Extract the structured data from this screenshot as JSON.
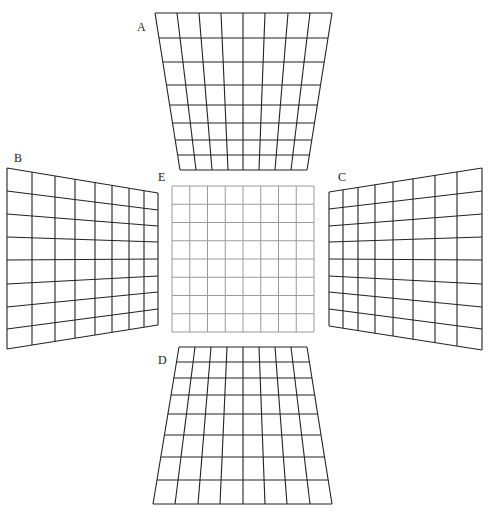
{
  "labels": {
    "A": "A",
    "B": "B",
    "C": "C",
    "D": "D",
    "E": "E"
  },
  "colors": {
    "distorted": "#222222",
    "reference": "#9a9a9a"
  },
  "grids": {
    "A": {
      "cols": [
        [
          155,
          180
        ],
        [
          171,
          193
        ],
        [
          189,
          207
        ],
        [
          208,
          223
        ],
        [
          227,
          240
        ],
        [
          247,
          256
        ],
        [
          268,
          272
        ],
        [
          290,
          290
        ],
        [
          332,
          307
        ]
      ],
      "top_y": 13,
      "bot_y": 170,
      "rows": [
        13,
        38,
        62,
        85,
        105,
        123,
        140,
        155,
        170
      ],
      "top_x": [
        155,
        177,
        199,
        221,
        243,
        265,
        288,
        310,
        332
      ],
      "bot_x": [
        180,
        196,
        212,
        228,
        243,
        259,
        275,
        291,
        307
      ]
    },
    "B": {
      "left_x": 7,
      "right_x": 158,
      "col_x": [
        7,
        32,
        55,
        75,
        95,
        112,
        129,
        144,
        158
      ],
      "left_y": [
        168,
        191,
        214,
        237,
        260,
        284,
        307,
        329,
        349
      ],
      "right_y": [
        193,
        210,
        226,
        242,
        259,
        276,
        292,
        309,
        325
      ]
    },
    "C": {
      "left_x": 329,
      "right_x": 482,
      "col_x": [
        329,
        343,
        358,
        375,
        393,
        413,
        435,
        457,
        482
      ],
      "left_y": [
        192,
        209,
        226,
        242,
        259,
        276,
        292,
        309,
        326
      ],
      "right_y": [
        168,
        191,
        214,
        237,
        260,
        284,
        307,
        329,
        350
      ]
    },
    "D": {
      "rows": [
        347,
        362,
        378,
        395,
        414,
        435,
        457,
        480,
        504
      ],
      "top_x": [
        179,
        195,
        211,
        227,
        243,
        259,
        275,
        291,
        307
      ],
      "bot_x": [
        153,
        175,
        198,
        220,
        243,
        265,
        287,
        310,
        332
      ]
    },
    "E": {
      "x0": 172,
      "x1": 314,
      "y0": 186,
      "y1": 332,
      "n": 8
    }
  }
}
